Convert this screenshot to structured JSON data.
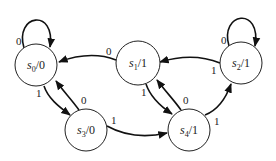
{
  "diagram": {
    "type": "finite-state-machine (Moore)",
    "states": [
      {
        "id": "s0",
        "name": "s",
        "sub": "0",
        "output": "0",
        "cx": 36,
        "cy": 65
      },
      {
        "id": "s1",
        "name": "s",
        "sub": "1",
        "output": "1",
        "cx": 138,
        "cy": 63
      },
      {
        "id": "s2",
        "name": "s",
        "sub": "2",
        "output": "1",
        "cx": 241,
        "cy": 63
      },
      {
        "id": "s3",
        "name": "s",
        "sub": "3",
        "output": "0",
        "cx": 86,
        "cy": 130
      },
      {
        "id": "s4",
        "name": "s",
        "sub": "4",
        "output": "1",
        "cx": 189,
        "cy": 130
      }
    ],
    "transitions": [
      {
        "from": "s0",
        "to": "s0",
        "input": "0"
      },
      {
        "from": "s0",
        "to": "s3",
        "input": "1"
      },
      {
        "from": "s1",
        "to": "s0",
        "input": "0"
      },
      {
        "from": "s1",
        "to": "s4",
        "input": "1"
      },
      {
        "from": "s2",
        "to": "s2",
        "input": "0"
      },
      {
        "from": "s2",
        "to": "s1",
        "input": "1"
      },
      {
        "from": "s3",
        "to": "s0",
        "input": "0"
      },
      {
        "from": "s3",
        "to": "s4",
        "input": "1"
      },
      {
        "from": "s4",
        "to": "s1",
        "input": "0"
      },
      {
        "from": "s4",
        "to": "s2",
        "input": "1"
      }
    ]
  },
  "labels": {
    "s0": {
      "name": "s",
      "sub": "0",
      "slash_out": "/0"
    },
    "s1": {
      "name": "s",
      "sub": "1",
      "slash_out": "/1"
    },
    "s2": {
      "name": "s",
      "sub": "2",
      "slash_out": "/1"
    },
    "s3": {
      "name": "s",
      "sub": "3",
      "slash_out": "/0"
    },
    "s4": {
      "name": "s",
      "sub": "4",
      "slash_out": "/1"
    },
    "e_s0_s0": "0",
    "e_s0_s3": "1",
    "e_s1_s0": "0",
    "e_s1_s4": "1",
    "e_s2_s2": "0",
    "e_s2_s1": "1",
    "e_s3_s0": "0",
    "e_s3_s4": "1",
    "e_s4_s1": "0",
    "e_s4_s2": "1"
  },
  "colors": {
    "stroke": "#111111",
    "background": "#ffffff"
  }
}
